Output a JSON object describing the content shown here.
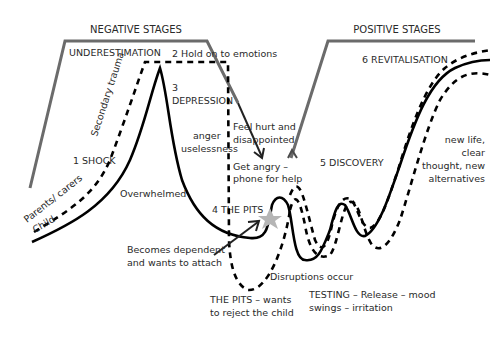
{
  "headers": {
    "negative": "NEGATIVE STAGES",
    "positive": "POSITIVE STAGES"
  },
  "stages": {
    "underestimation": "UNDERESTIMATION",
    "hold_on": "2 Hold on to emotions",
    "depression_num": "3",
    "depression": "DEPRESSION",
    "shock": "1 SHOCK",
    "pits": "4 THE PITS",
    "discovery": "5 DISCOVERY",
    "revitalisation": "6 REVITALISATION"
  },
  "annotations": {
    "secondary_trauma": "Secondary trauma",
    "parents_carers": "Parents/ carers",
    "child": "Child",
    "overwhelmed": "Overwhelmed",
    "anger": "anger",
    "uselessness": "uselessness",
    "feel_hurt_1": "Feel hurt and",
    "feel_hurt_2": "disappointed",
    "get_angry_1": "Get angry –",
    "get_angry_2": "phone for help",
    "dependent_1": "Becomes dependent",
    "dependent_2": "and wants to attach",
    "disruptions": "Disruptions occur",
    "pits_reject_1": "THE PITS – wants",
    "pits_reject_2": "to reject the child",
    "testing_1": "TESTING – Release – mood",
    "testing_2": "swings – irritation",
    "new_life_1": "new life,",
    "new_life_2": "clear",
    "new_life_3": "thought, new",
    "new_life_4": "alternatives"
  },
  "colors": {
    "frame": "#6b6b6b",
    "curve": "#000000",
    "star": "#b5b5b5",
    "text": "#2a2a2a"
  },
  "legend": {
    "solid_line": "Child",
    "dashed_line": "Parents/ carers"
  }
}
